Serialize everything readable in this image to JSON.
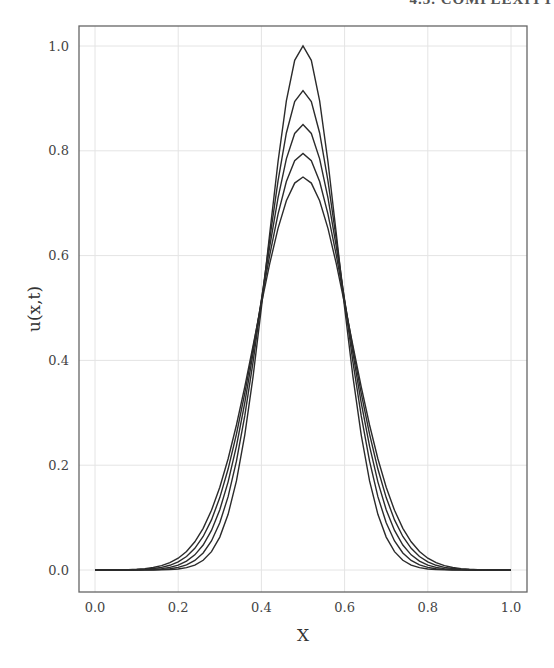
{
  "page": {
    "header_fragment": "4.3. COMPLEXITY"
  },
  "chart_data": {
    "type": "line",
    "title": "",
    "xlabel": "X",
    "ylabel": "u(x,t)",
    "xlim": [
      -0.04,
      1.04
    ],
    "ylim": [
      -0.042,
      1.04
    ],
    "grid": true,
    "legend": null,
    "x_ticks": [
      "0.0",
      "0.2",
      "0.4",
      "0.6",
      "0.8",
      "1.0"
    ],
    "y_ticks": [
      "0.0",
      "0.2",
      "0.4",
      "0.6",
      "0.8",
      "1.0"
    ],
    "x": [
      0.0,
      0.05,
      0.1,
      0.15,
      0.2,
      0.25,
      0.3,
      0.35,
      0.4,
      0.45,
      0.5,
      0.55,
      0.6,
      0.65,
      0.7,
      0.75,
      0.8,
      0.85,
      0.9,
      0.95,
      1.0
    ],
    "series": [
      {
        "name": "t0",
        "peak": 1.0,
        "sigma": 0.085,
        "values": [
          0,
          0,
          0,
          0,
          0,
          0.002,
          0.013,
          0.063,
          0.211,
          0.5,
          1.0,
          0.5,
          0.211,
          0.063,
          0.013,
          0.002,
          0,
          0,
          0,
          0,
          0
        ]
      },
      {
        "name": "t1",
        "peak": 0.915,
        "sigma": 0.0929,
        "values": [
          0,
          0,
          0,
          0,
          0,
          0.005,
          0.024,
          0.09,
          0.248,
          0.513,
          0.915,
          0.513,
          0.248,
          0.09,
          0.024,
          0.005,
          0,
          0,
          0,
          0,
          0
        ]
      },
      {
        "name": "t2",
        "peak": 0.85,
        "sigma": 0.1,
        "values": [
          0,
          0,
          0,
          0,
          0.002,
          0.009,
          0.037,
          0.115,
          0.276,
          0.516,
          0.85,
          0.516,
          0.276,
          0.115,
          0.037,
          0.009,
          0.002,
          0,
          0,
          0,
          0
        ]
      },
      {
        "name": "t3",
        "peak": 0.795,
        "sigma": 0.1069,
        "values": [
          0,
          0,
          0,
          0.001,
          0.004,
          0.016,
          0.052,
          0.138,
          0.297,
          0.513,
          0.795,
          0.513,
          0.297,
          0.138,
          0.052,
          0.016,
          0.004,
          0.001,
          0,
          0,
          0
        ]
      },
      {
        "name": "t4",
        "peak": 0.75,
        "sigma": 0.1133,
        "values": [
          0,
          0,
          0,
          0.001,
          0.006,
          0.023,
          0.066,
          0.158,
          0.312,
          0.508,
          0.75,
          0.508,
          0.312,
          0.158,
          0.066,
          0.023,
          0.006,
          0.001,
          0,
          0,
          0
        ]
      }
    ],
    "colors": {
      "line": "#2b2b2b",
      "grid": "#e4e4e4",
      "frame": "#666666"
    }
  }
}
